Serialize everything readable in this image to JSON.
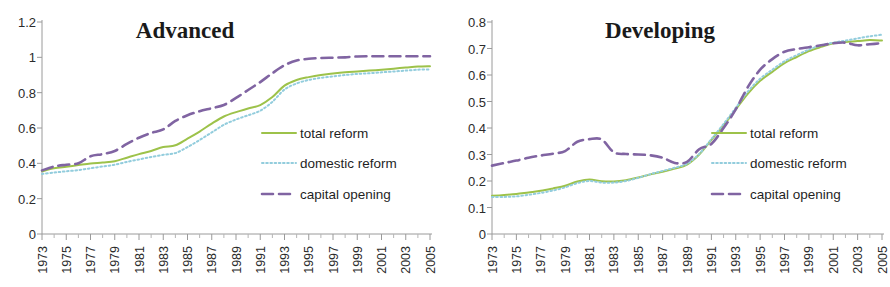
{
  "figure": {
    "width": 890,
    "height": 287,
    "background": "#ffffff"
  },
  "colors": {
    "total_reform": "#9DC24A",
    "domestic_reform": "#93CDDD",
    "capital_opening": "#8064A2",
    "axis": "#9a9a9a",
    "text": "#2b2b2b"
  },
  "chart_data": [
    {
      "type": "line",
      "title": "Advanced",
      "xlabel": "",
      "ylabel": "",
      "xlim": [
        1973,
        2005
      ],
      "ylim": [
        0,
        1.2
      ],
      "yticks": [
        "0",
        "0.2",
        "0.4",
        "0.6",
        "0.8",
        "1",
        "1.2"
      ],
      "ytick_values": [
        0,
        0.2,
        0.4,
        0.6,
        0.8,
        1.0,
        1.2
      ],
      "grid": false,
      "legend_position": "inside-right",
      "x": [
        1973,
        1974,
        1975,
        1976,
        1977,
        1978,
        1979,
        1980,
        1981,
        1982,
        1983,
        1984,
        1985,
        1986,
        1987,
        1988,
        1989,
        1990,
        1991,
        1992,
        1993,
        1994,
        1995,
        1996,
        1997,
        1998,
        1999,
        2000,
        2001,
        2002,
        2003,
        2004,
        2005
      ],
      "xtick_labels": [
        "1973",
        "1975",
        "1977",
        "1979",
        "1981",
        "1983",
        "1985",
        "1987",
        "1989",
        "1991",
        "1993",
        "1995",
        "1997",
        "1999",
        "2001",
        "2003",
        "2005"
      ],
      "series": [
        {
          "name": "total reform",
          "style": "solid",
          "color": "#9DC24A",
          "values": [
            0.355,
            0.372,
            0.381,
            0.39,
            0.399,
            0.405,
            0.412,
            0.432,
            0.452,
            0.47,
            0.492,
            0.502,
            0.54,
            0.58,
            0.625,
            0.665,
            0.69,
            0.71,
            0.73,
            0.775,
            0.84,
            0.872,
            0.888,
            0.9,
            0.908,
            0.915,
            0.92,
            0.925,
            0.93,
            0.936,
            0.942,
            0.948,
            0.95
          ]
        },
        {
          "name": "domestic reform",
          "style": "dotted",
          "color": "#93CDDD",
          "values": [
            0.34,
            0.348,
            0.355,
            0.362,
            0.372,
            0.382,
            0.392,
            0.408,
            0.422,
            0.436,
            0.448,
            0.458,
            0.492,
            0.532,
            0.575,
            0.618,
            0.648,
            0.672,
            0.698,
            0.748,
            0.818,
            0.852,
            0.872,
            0.884,
            0.892,
            0.9,
            0.906,
            0.91,
            0.915,
            0.92,
            0.925,
            0.93,
            0.932
          ]
        },
        {
          "name": "capital opening",
          "style": "dashed",
          "color": "#8064A2",
          "values": [
            0.36,
            0.382,
            0.392,
            0.4,
            0.44,
            0.452,
            0.47,
            0.51,
            0.545,
            0.572,
            0.592,
            0.64,
            0.672,
            0.695,
            0.712,
            0.73,
            0.77,
            0.815,
            0.86,
            0.91,
            0.955,
            0.982,
            0.992,
            0.996,
            0.998,
            1.0,
            1.005,
            1.006,
            1.006,
            1.006,
            1.006,
            1.006,
            1.006
          ]
        }
      ]
    },
    {
      "type": "line",
      "title": "Developing",
      "xlabel": "",
      "ylabel": "",
      "xlim": [
        1973,
        2005
      ],
      "ylim": [
        0,
        0.8
      ],
      "yticks": [
        "0",
        "0.1",
        "0.2",
        "0.3",
        "0.4",
        "0.5",
        "0.6",
        "0.7",
        "0.8"
      ],
      "ytick_values": [
        0,
        0.1,
        0.2,
        0.3,
        0.4,
        0.5,
        0.6,
        0.7,
        0.8
      ],
      "grid": false,
      "legend_position": "inside-right",
      "x": [
        1973,
        1974,
        1975,
        1976,
        1977,
        1978,
        1979,
        1980,
        1981,
        1982,
        1983,
        1984,
        1985,
        1986,
        1987,
        1988,
        1989,
        1990,
        1991,
        1992,
        1993,
        1994,
        1995,
        1996,
        1997,
        1998,
        1999,
        2000,
        2001,
        2002,
        2003,
        2004,
        2005
      ],
      "xtick_labels": [
        "1973",
        "1975",
        "1977",
        "1979",
        "1981",
        "1983",
        "1985",
        "1987",
        "1989",
        "1991",
        "1993",
        "1995",
        "1997",
        "1999",
        "2001",
        "2003",
        "2005"
      ],
      "series": [
        {
          "name": "total reform",
          "style": "solid",
          "color": "#9DC24A",
          "values": [
            0.144,
            0.147,
            0.151,
            0.157,
            0.163,
            0.172,
            0.182,
            0.198,
            0.206,
            0.199,
            0.198,
            0.203,
            0.213,
            0.225,
            0.235,
            0.247,
            0.262,
            0.3,
            0.355,
            0.41,
            0.47,
            0.53,
            0.578,
            0.612,
            0.645,
            0.668,
            0.69,
            0.706,
            0.72,
            0.725,
            0.728,
            0.732,
            0.73
          ]
        },
        {
          "name": "domestic reform",
          "style": "dotted",
          "color": "#93CDDD",
          "values": [
            0.14,
            0.14,
            0.142,
            0.148,
            0.155,
            0.164,
            0.176,
            0.192,
            0.2,
            0.194,
            0.194,
            0.2,
            0.212,
            0.226,
            0.238,
            0.25,
            0.265,
            0.302,
            0.358,
            0.415,
            0.476,
            0.538,
            0.586,
            0.62,
            0.652,
            0.675,
            0.696,
            0.712,
            0.722,
            0.73,
            0.738,
            0.746,
            0.752
          ]
        },
        {
          "name": "capital opening",
          "style": "dashed",
          "color": "#8064A2",
          "values": [
            0.258,
            0.268,
            0.277,
            0.288,
            0.296,
            0.303,
            0.313,
            0.348,
            0.358,
            0.357,
            0.308,
            0.302,
            0.3,
            0.297,
            0.288,
            0.268,
            0.272,
            0.32,
            0.34,
            0.4,
            0.47,
            0.555,
            0.62,
            0.66,
            0.688,
            0.698,
            0.705,
            0.712,
            0.72,
            0.722,
            0.712,
            0.716,
            0.72
          ]
        }
      ]
    }
  ],
  "legend": {
    "items": [
      {
        "label": "total reform",
        "style": "solid",
        "color": "#9DC24A"
      },
      {
        "label": "domestic reform",
        "style": "dotted",
        "color": "#93CDDD"
      },
      {
        "label": "capital opening",
        "style": "dashed",
        "color": "#8064A2"
      }
    ]
  }
}
